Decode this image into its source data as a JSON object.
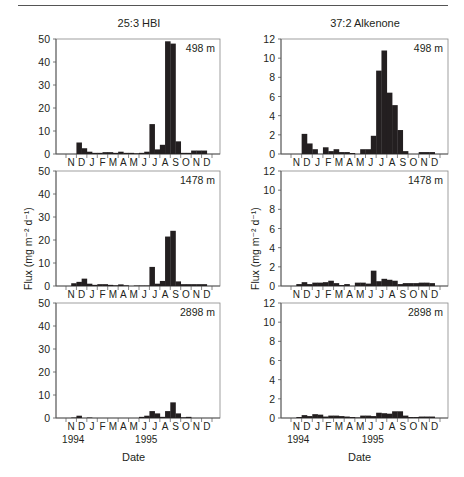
{
  "figure": {
    "columns": [
      {
        "title": "25:3 HBI",
        "ymax": 50,
        "yticks": [
          0,
          10,
          20,
          30,
          40,
          50
        ]
      },
      {
        "title": "37:2 Alkenone",
        "ymax": 12,
        "yticks": [
          0,
          2,
          4,
          6,
          8,
          10,
          12
        ]
      }
    ],
    "depth_labels": [
      "498 m",
      "1478 m",
      "2898 m"
    ],
    "month_labels": [
      "N",
      "D",
      "J",
      "F",
      "M",
      "A",
      "M",
      "J",
      "J",
      "A",
      "S",
      "O",
      "N",
      "D"
    ],
    "year_labels": [
      {
        "label": "1994",
        "month_index": 0.5
      },
      {
        "label": "1995",
        "month_index": 7.5
      }
    ],
    "ylabel": "Flux (mg m⁻² d⁻¹)",
    "xlabel": "Date"
  },
  "chart_data": [
    {
      "type": "bar",
      "title": "25:3 HBI",
      "panel": "498 m",
      "xlabel": "Date",
      "ylabel": "Flux (mg m-2 d-1)",
      "ylim": [
        0,
        50
      ],
      "categories": [
        "N",
        "D",
        "J",
        "F",
        "M",
        "A",
        "M",
        "J",
        "J",
        "A",
        "S",
        "O",
        "N",
        "D"
      ],
      "x_bins": 28,
      "values": [
        0,
        0,
        5,
        2.5,
        1,
        0.5,
        0.5,
        0.8,
        0.8,
        0.5,
        1,
        0.5,
        0.5,
        0.3,
        0.5,
        1,
        13,
        2,
        4,
        49,
        48,
        5.5,
        0.5,
        0.5,
        1.5,
        1.5,
        1.5,
        0
      ]
    },
    {
      "type": "bar",
      "title": "25:3 HBI",
      "panel": "1478 m",
      "xlabel": "Date",
      "ylabel": "Flux (mg m-2 d-1)",
      "ylim": [
        0,
        50
      ],
      "categories": [
        "N",
        "D",
        "J",
        "F",
        "M",
        "A",
        "M",
        "J",
        "J",
        "A",
        "S",
        "O",
        "N",
        "D"
      ],
      "x_bins": 28,
      "values": [
        0,
        1.2,
        1.8,
        3.2,
        1,
        0.5,
        0.8,
        0.8,
        0.5,
        0.3,
        0.7,
        0.3,
        0,
        0.2,
        0.2,
        0.2,
        8.3,
        1,
        2.2,
        21.5,
        24,
        2,
        0.8,
        0.8,
        0.8,
        0.8,
        0.8,
        0
      ]
    },
    {
      "type": "bar",
      "title": "25:3 HBI",
      "panel": "2898 m",
      "xlabel": "Date",
      "ylabel": "Flux (mg m-2 d-1)",
      "ylim": [
        0,
        50
      ],
      "categories": [
        "N",
        "D",
        "J",
        "F",
        "M",
        "A",
        "M",
        "J",
        "J",
        "A",
        "S",
        "O",
        "N",
        "D"
      ],
      "x_bins": 28,
      "values": [
        0,
        0.2,
        1,
        0,
        0.2,
        0,
        0,
        0,
        0,
        0,
        0,
        0,
        0,
        0,
        0.5,
        1,
        3,
        2,
        0.5,
        3,
        6.8,
        2,
        0.3,
        0.5,
        0,
        0,
        0,
        0
      ]
    },
    {
      "type": "bar",
      "title": "37:2 Alkenone",
      "panel": "498 m",
      "xlabel": "Date",
      "ylabel": "Flux (mg m-2 d-1)",
      "ylim": [
        0,
        12
      ],
      "categories": [
        "N",
        "D",
        "J",
        "F",
        "M",
        "A",
        "M",
        "J",
        "J",
        "A",
        "S",
        "O",
        "N",
        "D"
      ],
      "x_bins": 28,
      "values": [
        0,
        0,
        2.1,
        1.1,
        0.5,
        0,
        0.7,
        0.3,
        0.5,
        0.2,
        0.2,
        0.1,
        0,
        0.5,
        0.5,
        1.9,
        8.7,
        10.8,
        6.4,
        5.1,
        2.5,
        0.3,
        0,
        0,
        0.2,
        0.2,
        0.2,
        0
      ]
    },
    {
      "type": "bar",
      "title": "37:2 Alkenone",
      "panel": "1478 m",
      "xlabel": "Date",
      "ylabel": "Flux (mg m-2 d-1)",
      "ylim": [
        0,
        12
      ],
      "categories": [
        "N",
        "D",
        "J",
        "F",
        "M",
        "A",
        "M",
        "J",
        "J",
        "A",
        "S",
        "O",
        "N",
        "D"
      ],
      "x_bins": 28,
      "values": [
        0,
        0.2,
        0.4,
        0.2,
        0.35,
        0.35,
        0.4,
        0.55,
        0.3,
        0.1,
        0.2,
        0,
        0.35,
        0.35,
        0.25,
        1.6,
        0.5,
        0.75,
        0.65,
        0.55,
        0.2,
        0.3,
        0.3,
        0.3,
        0.35,
        0.35,
        0.3,
        0
      ]
    },
    {
      "type": "bar",
      "title": "37:2 Alkenone",
      "panel": "2898 m",
      "xlabel": "Date",
      "ylabel": "Flux (mg m-2 d-1)",
      "ylim": [
        0,
        12
      ],
      "categories": [
        "N",
        "D",
        "J",
        "F",
        "M",
        "A",
        "M",
        "J",
        "J",
        "A",
        "S",
        "O",
        "N",
        "D"
      ],
      "x_bins": 28,
      "values": [
        0,
        0.1,
        0.3,
        0.2,
        0.4,
        0.35,
        0.15,
        0.25,
        0.25,
        0.2,
        0.15,
        0.1,
        0.05,
        0.25,
        0.25,
        0.2,
        0.55,
        0.5,
        0.45,
        0.7,
        0.7,
        0.25,
        0.1,
        0.1,
        0.15,
        0.15,
        0.15,
        0
      ]
    }
  ]
}
